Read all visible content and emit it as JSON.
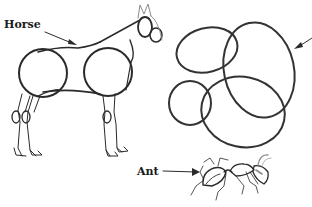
{
  "figure": {
    "labels": {
      "horse": "Horse",
      "ant": "Ant"
    },
    "panels": [
      {
        "id": "horse",
        "description": "Horse sketch built from two body circles, head ovals and jointed legs"
      },
      {
        "id": "circles",
        "description": "Five overlapping ovals construction sketch with arrow pointing in from right edge"
      },
      {
        "id": "ant",
        "description": "Ant sketch with segmented body, legs and antenna"
      }
    ],
    "colors": {
      "ink": "#2a2a2a",
      "light_ink": "#8a8a8a",
      "background": "#ffffff"
    }
  }
}
